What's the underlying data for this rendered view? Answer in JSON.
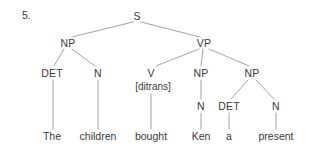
{
  "figure": {
    "item_number": "5.",
    "sentence": "The children bought Ken a present",
    "line_color": "#9a9a9a",
    "text_color": "#3a3a3a",
    "background_color": "#ffffff"
  },
  "tree": {
    "root": {
      "label": "S",
      "x": 137,
      "y": 16
    },
    "nodes": [
      {
        "id": "np-subject",
        "label": "NP",
        "x": 68,
        "y": 43
      },
      {
        "id": "vp",
        "label": "VP",
        "x": 204,
        "y": 43
      },
      {
        "id": "det-1",
        "label": "DET",
        "x": 52,
        "y": 73
      },
      {
        "id": "n-1",
        "label": "N",
        "x": 98,
        "y": 73
      },
      {
        "id": "v",
        "label": "V",
        "x": 151,
        "y": 73
      },
      {
        "id": "np-object-1",
        "label": "NP",
        "x": 201,
        "y": 73
      },
      {
        "id": "np-object-2",
        "label": "NP",
        "x": 252,
        "y": 73
      },
      {
        "id": "n-2",
        "label": "N",
        "x": 201,
        "y": 106
      },
      {
        "id": "det-2",
        "label": "DET",
        "x": 229,
        "y": 106
      },
      {
        "id": "n-3",
        "label": "N",
        "x": 276,
        "y": 106
      }
    ],
    "features": [
      {
        "id": "v-feature",
        "label": "[ditrans]",
        "x": 153,
        "y": 86
      }
    ],
    "leaves": [
      {
        "id": "leaf-the",
        "label": "The",
        "x": 52,
        "y": 136
      },
      {
        "id": "leaf-children",
        "label": "children",
        "x": 98,
        "y": 136
      },
      {
        "id": "leaf-bought",
        "label": "bought",
        "x": 151,
        "y": 136
      },
      {
        "id": "leaf-ken",
        "label": "Ken",
        "x": 201,
        "y": 136
      },
      {
        "id": "leaf-a",
        "label": "a",
        "x": 229,
        "y": 136
      },
      {
        "id": "leaf-present",
        "label": "present",
        "x": 276,
        "y": 136
      }
    ]
  }
}
